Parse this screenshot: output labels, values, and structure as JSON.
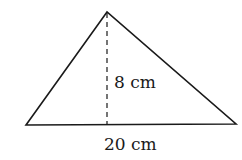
{
  "diagram": {
    "shape": "triangle",
    "height_label": "8 cm",
    "base_label": "20 cm",
    "colors": {
      "stroke": "#1a1a1a",
      "background": "#ffffff"
    }
  }
}
